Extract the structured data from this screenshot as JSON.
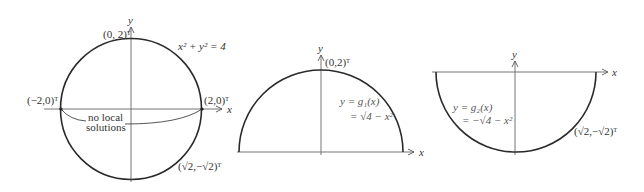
{
  "figures": [
    {
      "id": "full-circle",
      "equation": "x² + y² = 4",
      "axis_x": "x",
      "axis_y": "y",
      "points": {
        "top": "(0, 2)ᵀ",
        "left": "(−2,0)ᵀ",
        "right": "(2,0)ᵀ",
        "lower_right": "(√2,−√2)ᵀ"
      },
      "annotation_line1": "no local",
      "annotation_line2": "solutions"
    },
    {
      "id": "upper-semicircle",
      "axis_x": "x",
      "axis_y": "y",
      "point_top": "(0,2)ᵀ",
      "function_line1": "y = g₁(x)",
      "function_line2": "= √4 − x²"
    },
    {
      "id": "lower-semicircle",
      "axis_x": "x",
      "axis_y": "y",
      "point": "(√2,−√2)ᵀ",
      "function_line1": "y = g₂(x)",
      "function_line2": "= −√4 − x²"
    }
  ],
  "colors": {
    "curve": "#2a2a2a",
    "axis": "#555555",
    "text": "#333333"
  }
}
